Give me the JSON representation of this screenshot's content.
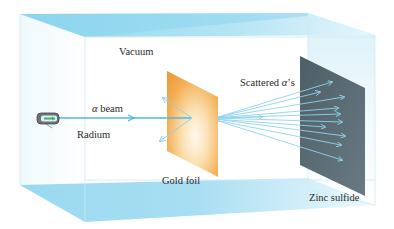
{
  "diagram": {
    "labels": {
      "vacuum": "Vacuum",
      "alpha_symbol": "α",
      "beam": " beam",
      "radium": "Radium",
      "gold_foil": "Gold foil",
      "scattered_prefix": "Scattered ",
      "scattered_alpha": "α",
      "scattered_suffix": "’s",
      "zinc_sulfide": "Zinc sulfide"
    },
    "colors": {
      "chamber_cyan": "#9fdcf0",
      "chamber_edge": "#c8e9f4",
      "beam": "#4fb8e0",
      "foil_orange": "#f0a040",
      "foil_light": "#fff6e8",
      "screen": "#5a6a72",
      "ray": "#8fd2ee"
    },
    "components": [
      "Vacuum chamber",
      "Radium source",
      "Alpha beam",
      "Gold foil",
      "Scattered alpha particles",
      "Zinc sulfide screen"
    ]
  }
}
